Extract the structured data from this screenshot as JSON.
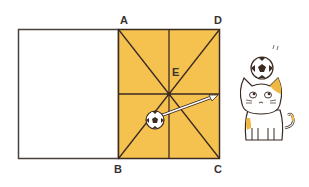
{
  "diagram": {
    "labels": {
      "A": "A",
      "B": "B",
      "C": "C",
      "D": "D",
      "E": "E"
    },
    "colors": {
      "square_fill": "#f6c24f",
      "line": "#3a2a22",
      "background": "#ffffff"
    },
    "elements": [
      "white rectangle adjacent to square ABCD",
      "yellow square ABCD divided by diagonals and midlines, center E",
      "soccer ball with arrow pointing toward side DC",
      "cat with soccer ball on head"
    ]
  }
}
